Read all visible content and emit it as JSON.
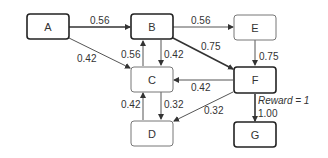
{
  "diagram": {
    "type": "state-transition-graph",
    "nodes": [
      {
        "id": "A",
        "label": "A",
        "bold": true
      },
      {
        "id": "B",
        "label": "B",
        "bold": true
      },
      {
        "id": "C",
        "label": "C",
        "bold": false
      },
      {
        "id": "D",
        "label": "D",
        "bold": false
      },
      {
        "id": "E",
        "label": "E",
        "bold": false
      },
      {
        "id": "F",
        "label": "F",
        "bold": true
      },
      {
        "id": "G",
        "label": "G",
        "bold": true
      }
    ],
    "edges": [
      {
        "from": "A",
        "to": "B",
        "label": "0.56",
        "bold": true
      },
      {
        "from": "A",
        "to": "C",
        "label": "0.42",
        "bold": false
      },
      {
        "from": "B",
        "to": "E",
        "label": "0.56",
        "bold": false
      },
      {
        "from": "B",
        "to": "F",
        "label": "0.75",
        "bold": true
      },
      {
        "from": "B",
        "to": "C",
        "label": "0.42",
        "bold": false
      },
      {
        "from": "C",
        "to": "B",
        "label": "0.56",
        "bold": false
      },
      {
        "from": "E",
        "to": "F",
        "label": "0.75",
        "bold": false
      },
      {
        "from": "F",
        "to": "C",
        "label": "0.42",
        "bold": false
      },
      {
        "from": "F",
        "to": "D",
        "label": "0.32",
        "bold": false
      },
      {
        "from": "C",
        "to": "D",
        "label": "0.32",
        "bold": false
      },
      {
        "from": "D",
        "to": "C",
        "label": "0.42",
        "bold": false
      },
      {
        "from": "F",
        "to": "G",
        "label": "1.00",
        "bold": true
      }
    ],
    "annotation": "Reward = 1"
  }
}
